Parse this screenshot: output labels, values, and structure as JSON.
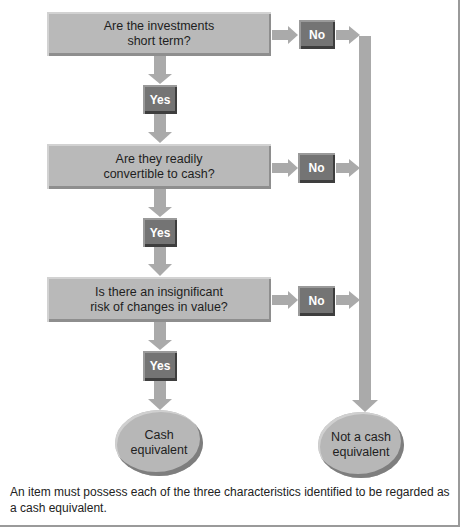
{
  "diagram": {
    "type": "flowchart",
    "questions": [
      {
        "line1": "Are the investments",
        "line2": "short term?"
      },
      {
        "line1": "Are they readily",
        "line2": "convertible to cash?"
      },
      {
        "line1": "Is there an insignificant",
        "line2": "risk of changes in value?"
      }
    ],
    "yes_label": "Yes",
    "no_label": "No",
    "outcomes": {
      "positive": {
        "line1": "Cash",
        "line2": "equivalent"
      },
      "negative": {
        "line1": "Not a cash",
        "line2": "equivalent"
      }
    },
    "caption": "An item must possess each of the three characteristics identified to be regarded as a cash equivalent.",
    "colors": {
      "box": "#b9b9b9",
      "badge": "#747474",
      "arrow": "#aaaaaa",
      "border": "#9a9a9a"
    }
  }
}
